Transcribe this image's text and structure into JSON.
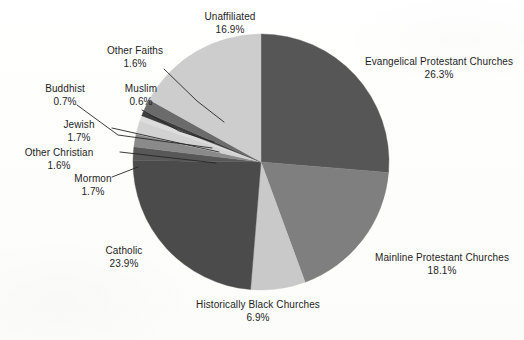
{
  "chart_data": {
    "type": "pie",
    "title": "",
    "subtitle": "",
    "legend_position": "callout-labels",
    "grid": false,
    "start_angle_deg": 0,
    "direction": "clockwise",
    "units": "percent",
    "categories": [
      "Evangelical Protestant Churches",
      "Mainline Protestant Churches",
      "Historically Black Churches",
      "Catholic",
      "Mormon",
      "Other Christian",
      "Jewish",
      "Buddhist",
      "Muslim",
      "Other Faiths",
      "Unaffiliated"
    ],
    "values": [
      26.3,
      18.1,
      6.9,
      23.9,
      1.7,
      1.6,
      1.7,
      0.7,
      0.6,
      1.6,
      16.9
    ],
    "value_labels": [
      "26.3%",
      "18.1%",
      "6.9%",
      "23.9%",
      "1.7%",
      "1.6%",
      "1.7%",
      "0.7%",
      "0.6%",
      "1.6%",
      "16.9%"
    ],
    "colors": [
      "#565656",
      "#7f7f7f",
      "#c9c9c9",
      "#4b4b4b",
      "#585858",
      "#8a8a8a",
      "#d2d2d2",
      "#dcdcdc",
      "#3d3d3d",
      "#6b6b6b",
      "#cdcdcd"
    ],
    "slices": [
      {
        "label": "Evangelical Protestant Churches",
        "percent_text": "26.3%",
        "value": 26.3,
        "color": "#565656"
      },
      {
        "label": "Mainline Protestant Churches",
        "percent_text": "18.1%",
        "value": 18.1,
        "color": "#7f7f7f"
      },
      {
        "label": "Historically Black Churches",
        "percent_text": "6.9%",
        "value": 6.9,
        "color": "#c9c9c9"
      },
      {
        "label": "Catholic",
        "percent_text": "23.9%",
        "value": 23.9,
        "color": "#4b4b4b"
      },
      {
        "label": "Mormon",
        "percent_text": "1.7%",
        "value": 1.7,
        "color": "#585858"
      },
      {
        "label": "Other Christian",
        "percent_text": "1.6%",
        "value": 1.6,
        "color": "#8a8a8a"
      },
      {
        "label": "Jewish",
        "percent_text": "1.7%",
        "value": 1.7,
        "color": "#d2d2d2"
      },
      {
        "label": "Buddhist",
        "percent_text": "0.7%",
        "value": 0.7,
        "color": "#dcdcdc"
      },
      {
        "label": "Muslim",
        "percent_text": "0.6%",
        "value": 0.6,
        "color": "#3d3d3d"
      },
      {
        "label": "Other Faiths",
        "percent_text": "1.6%",
        "value": 1.6,
        "color": "#6b6b6b"
      },
      {
        "label": "Unaffiliated",
        "percent_text": "16.9%",
        "value": 16.9,
        "color": "#cdcdcd"
      }
    ],
    "total": 100.0
  },
  "geometry": {
    "center_x": 261,
    "center_y": 162,
    "radius": 128
  },
  "labels": {
    "unaffiliated": {
      "name": "Unaffiliated",
      "pct": "16.9%"
    },
    "other_faiths": {
      "name": "Other Faiths",
      "pct": "1.6%"
    },
    "buddhist": {
      "name": "Buddhist",
      "pct": "0.7%"
    },
    "muslim": {
      "name": "Muslim",
      "pct": "0.6%"
    },
    "jewish": {
      "name": "Jewish",
      "pct": "1.7%"
    },
    "other_christian": {
      "name": "Other Christian",
      "pct": "1.6%"
    },
    "mormon": {
      "name": "Mormon",
      "pct": "1.7%"
    },
    "catholic": {
      "name": "Catholic",
      "pct": "23.9%"
    },
    "historically_black": {
      "name": "Historically Black Churches",
      "pct": "6.9%"
    },
    "mainline": {
      "name": "Mainline Protestant Churches",
      "pct": "18.1%"
    },
    "evangelical": {
      "name": "Evangelical Protestant Churches",
      "pct": "26.3%"
    }
  }
}
